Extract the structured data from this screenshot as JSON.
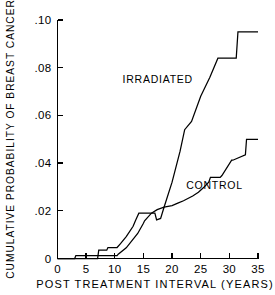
{
  "chart_data": {
    "type": "line",
    "title": "",
    "xlabel": "POST TREATMENT INTERVAL (YEARS)",
    "ylabel": "CUMULATIVE PROBABILITY OF BREAST CANCER",
    "xlim": [
      0,
      35
    ],
    "ylim": [
      0,
      0.1
    ],
    "xticks": [
      0,
      5,
      10,
      15,
      20,
      25,
      30,
      35
    ],
    "xticklabels": [
      "0",
      "5",
      "10",
      "15",
      "20",
      "25",
      "30",
      "35"
    ],
    "yticks": [
      0,
      0.02,
      0.04,
      0.06,
      0.08,
      0.1
    ],
    "yticklabels": [
      "0",
      ".02",
      ".04",
      ".06",
      ".08",
      ".10"
    ],
    "grid": false,
    "legend_position": "inline-annotation",
    "line_color": "#000000",
    "background_color": "#ffffff",
    "series": [
      {
        "name": "IRRADIATED",
        "label_x": 17.5,
        "label_y": 0.0735,
        "x": [
          0,
          7.0,
          7.2,
          8.6,
          8.8,
          10.4,
          11.0,
          12.0,
          13.2,
          13.6,
          14.2,
          17.0,
          17.3,
          18.0,
          18.6,
          20.0,
          21.4,
          22.2,
          23.4,
          25.0,
          26.6,
          28.0,
          28.4,
          31.2,
          31.5,
          35.0
        ],
        "y": [
          0.0,
          0.0,
          0.0035,
          0.0035,
          0.0046,
          0.0046,
          0.0062,
          0.0092,
          0.0135,
          0.0158,
          0.019,
          0.019,
          0.0162,
          0.0168,
          0.0215,
          0.032,
          0.045,
          0.054,
          0.0575,
          0.068,
          0.076,
          0.084,
          0.084,
          0.084,
          0.095,
          0.095
        ]
      },
      {
        "name": "CONTROL",
        "label_x": 27.4,
        "label_y": 0.029,
        "x": [
          0,
          3.0,
          3.2,
          10.4,
          10.6,
          12.0,
          14.0,
          15.0,
          15.2,
          16.4,
          17.4,
          18.6,
          20.0,
          21.0,
          22.0,
          23.6,
          24.6,
          25.6,
          26.4,
          26.7,
          28.4,
          28.7,
          30.4,
          30.6,
          32.8,
          33.0,
          35.0
        ],
        "y": [
          0.0,
          0.0,
          0.0012,
          0.0012,
          0.0018,
          0.0045,
          0.0105,
          0.0148,
          0.0158,
          0.019,
          0.0205,
          0.0215,
          0.0222,
          0.0232,
          0.0242,
          0.0262,
          0.0278,
          0.03,
          0.032,
          0.034,
          0.034,
          0.0348,
          0.0412,
          0.0412,
          0.0435,
          0.05,
          0.05
        ]
      }
    ]
  },
  "axes": {
    "y_axis_label": "CUMULATIVE PROBABILITY OF BREAST CANCER",
    "x_axis_label": "POST TREATMENT INTERVAL (YEARS)"
  }
}
